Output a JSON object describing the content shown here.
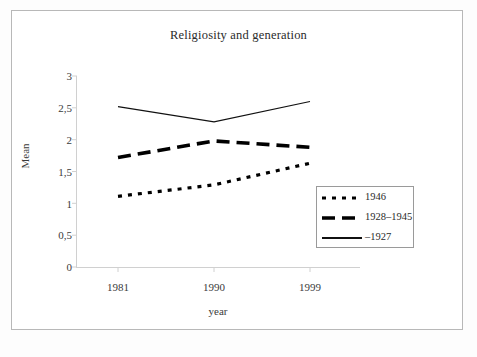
{
  "figure": {
    "border_color": "#b8b8b8",
    "background": "#ffffff"
  },
  "chart_data": {
    "type": "line",
    "title": "Religiosity and generation",
    "xlabel": "year",
    "ylabel": "Mean",
    "categories": [
      "1981",
      "1990",
      "1999"
    ],
    "x_tick_labels": [
      "1981",
      "1990",
      "1999"
    ],
    "y_tick_labels": [
      "0",
      "0,5",
      "1",
      "1,5",
      "2",
      "2,5",
      "3"
    ],
    "y_tick_values": [
      0,
      0.5,
      1,
      1.5,
      2,
      2.5,
      3
    ],
    "ylim": [
      0,
      3
    ],
    "grid": false,
    "legend_position": "lower-right",
    "series": [
      {
        "name": "1946",
        "style": "dotted",
        "color": "#000000",
        "values": [
          1.11,
          1.29,
          1.63
        ]
      },
      {
        "name": "1928–1945",
        "style": "dashed",
        "color": "#000000",
        "values": [
          1.72,
          1.98,
          1.88
        ]
      },
      {
        "name": "–1927",
        "style": "solid",
        "color": "#000000",
        "values": [
          2.52,
          2.28,
          2.6
        ]
      }
    ]
  },
  "axis": {
    "y_title": "Mean",
    "x_title": "year"
  },
  "legend": {
    "entries": [
      {
        "label": "1946",
        "style": "dotted"
      },
      {
        "label": "1928–1945",
        "style": "dashed"
      },
      {
        "label": "–1927",
        "style": "solid"
      }
    ]
  }
}
